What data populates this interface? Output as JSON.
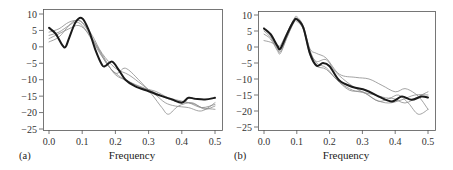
{
  "chart_data": [
    {
      "panel": "(a)",
      "type": "line",
      "title": "",
      "xlabel": "Frequency",
      "ylabel": "",
      "xlim": [
        0,
        0.5
      ],
      "ylim": [
        -27,
        11
      ],
      "xticks": [
        0.0,
        0.1,
        0.2,
        0.3,
        0.4,
        0.5
      ],
      "xtick_labels": [
        "0.0",
        "0.1",
        "0.2",
        "0.3",
        "0.4",
        "0.5"
      ],
      "yticks": [
        10,
        5,
        0,
        -5,
        -10,
        -15,
        -20,
        -25
      ],
      "ytick_labels": [
        "10",
        "5",
        "0",
        "−5",
        "−10",
        "−15",
        "−20",
        "−25"
      ],
      "grid": false,
      "legend": null,
      "series": [
        {
          "name": "estimate (bold)",
          "style": "bold",
          "x": [
            0.0,
            0.02,
            0.04,
            0.05,
            0.06,
            0.08,
            0.1,
            0.12,
            0.14,
            0.16,
            0.17,
            0.19,
            0.21,
            0.23,
            0.26,
            0.3,
            0.34,
            0.37,
            0.4,
            0.42,
            0.44,
            0.47,
            0.5
          ],
          "y": [
            5.8,
            4.0,
            0.5,
            0.0,
            2.5,
            7.5,
            8.7,
            5.0,
            -1.0,
            -5.5,
            -5.8,
            -4.5,
            -7.0,
            -10.0,
            -12.0,
            -13.5,
            -15.0,
            -16.0,
            -17.0,
            -15.5,
            -15.8,
            -16.0,
            -15.5
          ]
        },
        {
          "name": "replicate 1",
          "style": "thin",
          "x": [
            0.0,
            0.03,
            0.06,
            0.08,
            0.1,
            0.13,
            0.16,
            0.2,
            0.24,
            0.28,
            0.32,
            0.35,
            0.38,
            0.42,
            0.46,
            0.5
          ],
          "y": [
            1.5,
            3.0,
            6.5,
            8.0,
            7.5,
            3.5,
            -2.0,
            -6.5,
            -8.5,
            -11.5,
            -14.5,
            -17.0,
            -18.0,
            -18.5,
            -19.5,
            -17.0
          ]
        },
        {
          "name": "replicate 2",
          "style": "thin",
          "x": [
            0.0,
            0.03,
            0.06,
            0.08,
            0.1,
            0.13,
            0.16,
            0.2,
            0.23,
            0.27,
            0.31,
            0.34,
            0.36,
            0.39,
            0.43,
            0.46,
            0.5
          ],
          "y": [
            3.5,
            4.5,
            6.5,
            7.5,
            6.5,
            2.0,
            -3.0,
            -8.0,
            -6.5,
            -10.0,
            -14.5,
            -18.5,
            -20.5,
            -18.0,
            -17.0,
            -18.5,
            -19.0
          ]
        },
        {
          "name": "replicate 3",
          "style": "thin",
          "x": [
            0.0,
            0.03,
            0.06,
            0.09,
            0.11,
            0.14,
            0.17,
            0.2,
            0.24,
            0.28,
            0.32,
            0.36,
            0.4,
            0.44,
            0.47,
            0.5
          ],
          "y": [
            4.5,
            5.5,
            7.5,
            8.0,
            6.0,
            1.0,
            -4.0,
            -8.5,
            -10.5,
            -12.5,
            -13.5,
            -15.5,
            -16.5,
            -17.5,
            -19.0,
            -18.0
          ]
        },
        {
          "name": "replicate 4",
          "style": "thin",
          "x": [
            0.0,
            0.03,
            0.06,
            0.09,
            0.12,
            0.15,
            0.18,
            0.22,
            0.26,
            0.3,
            0.34,
            0.38,
            0.42,
            0.46,
            0.5
          ],
          "y": [
            2.5,
            4.0,
            5.5,
            6.5,
            4.0,
            -1.0,
            -6.0,
            -9.5,
            -11.5,
            -13.0,
            -15.0,
            -16.5,
            -17.0,
            -18.5,
            -17.5
          ]
        }
      ]
    },
    {
      "panel": "(b)",
      "type": "line",
      "title": "",
      "xlabel": "Frequency",
      "ylabel": "",
      "xlim": [
        0,
        0.5
      ],
      "ylim": [
        -27,
        11
      ],
      "xticks": [
        0.0,
        0.1,
        0.2,
        0.3,
        0.4,
        0.5
      ],
      "xtick_labels": [
        "0.0",
        "0.1",
        "0.2",
        "0.3",
        "0.4",
        "0.5"
      ],
      "yticks": [
        10,
        5,
        0,
        -5,
        -10,
        -15,
        -20,
        -25
      ],
      "ytick_labels": [
        "10",
        "5",
        "0",
        "−5",
        "−10",
        "−15",
        "−20",
        "−25"
      ],
      "grid": false,
      "legend": null,
      "series": [
        {
          "name": "estimate (bold)",
          "style": "bold",
          "x": [
            0.0,
            0.02,
            0.04,
            0.05,
            0.07,
            0.09,
            0.1,
            0.12,
            0.14,
            0.16,
            0.18,
            0.2,
            0.23,
            0.27,
            0.31,
            0.35,
            0.39,
            0.42,
            0.45,
            0.48,
            0.5
          ],
          "y": [
            5.8,
            4.0,
            0.5,
            -0.5,
            4.0,
            8.0,
            8.7,
            6.0,
            -2.0,
            -5.8,
            -5.0,
            -6.0,
            -10.5,
            -12.5,
            -13.5,
            -15.5,
            -17.0,
            -15.5,
            -16.5,
            -15.5,
            -15.8
          ]
        },
        {
          "name": "replicate 1",
          "style": "thin",
          "x": [
            0.0,
            0.02,
            0.04,
            0.05,
            0.07,
            0.09,
            0.1,
            0.12,
            0.14,
            0.16,
            0.19,
            0.23,
            0.28,
            0.32,
            0.36,
            0.4,
            0.43,
            0.46,
            0.48,
            0.5
          ],
          "y": [
            2.0,
            1.5,
            0.5,
            0.5,
            4.5,
            8.5,
            9.5,
            6.5,
            -0.5,
            -2.0,
            -3.5,
            -8.5,
            -9.5,
            -10.0,
            -12.0,
            -14.0,
            -13.0,
            -14.5,
            -16.5,
            -19.5
          ]
        },
        {
          "name": "replicate 2",
          "style": "thin",
          "x": [
            0.0,
            0.02,
            0.04,
            0.05,
            0.07,
            0.09,
            0.1,
            0.12,
            0.14,
            0.16,
            0.19,
            0.22,
            0.26,
            0.3,
            0.34,
            0.38,
            0.41,
            0.44,
            0.47,
            0.5
          ],
          "y": [
            4.0,
            2.5,
            -1.0,
            -2.0,
            3.0,
            7.5,
            8.0,
            5.5,
            -1.5,
            -4.5,
            -4.0,
            -8.0,
            -11.5,
            -14.0,
            -15.0,
            -16.0,
            -15.0,
            -17.5,
            -21.0,
            -19.5
          ]
        },
        {
          "name": "replicate 3",
          "style": "thin",
          "x": [
            0.0,
            0.02,
            0.04,
            0.05,
            0.07,
            0.09,
            0.1,
            0.12,
            0.14,
            0.16,
            0.19,
            0.22,
            0.26,
            0.3,
            0.34,
            0.38,
            0.42,
            0.46,
            0.5
          ],
          "y": [
            5.5,
            3.5,
            0.0,
            -1.0,
            3.5,
            8.0,
            9.0,
            6.0,
            -1.0,
            -5.0,
            -6.5,
            -10.0,
            -13.5,
            -14.0,
            -16.5,
            -17.5,
            -16.5,
            -15.0,
            -15.0
          ]
        },
        {
          "name": "replicate 4",
          "style": "thin",
          "x": [
            0.0,
            0.02,
            0.04,
            0.05,
            0.07,
            0.09,
            0.1,
            0.12,
            0.14,
            0.16,
            0.19,
            0.23,
            0.27,
            0.31,
            0.35,
            0.39,
            0.43,
            0.47,
            0.5
          ],
          "y": [
            5.0,
            3.0,
            -0.5,
            -1.5,
            3.0,
            7.5,
            8.5,
            5.5,
            -2.5,
            -6.0,
            -7.0,
            -11.0,
            -13.5,
            -14.5,
            -17.0,
            -16.0,
            -17.5,
            -15.5,
            -14.0
          ]
        }
      ]
    }
  ],
  "panels": [
    {
      "label": "(a)",
      "xlabel": "Frequency",
      "frame": {
        "left": 43,
        "top": 9,
        "right": 222,
        "bottom": 130
      },
      "xmap": {
        "x0": 49,
        "x1": 215
      },
      "ymap": {
        "v_top": 10,
        "y_top": 14,
        "v_bot": -25,
        "y_bot": 129
      }
    },
    {
      "label": "(b)",
      "xlabel": "Frequency",
      "frame": {
        "left": 258,
        "top": 11,
        "right": 435,
        "bottom": 130
      },
      "xmap": {
        "x0": 264,
        "x1": 428
      },
      "ymap": {
        "v_top": 10,
        "y_top": 15,
        "v_bot": -25,
        "y_bot": 127
      }
    }
  ],
  "colors": {
    "bold": "#1a1a1a",
    "thin": "#8c8c8c",
    "axis": "#555555"
  }
}
